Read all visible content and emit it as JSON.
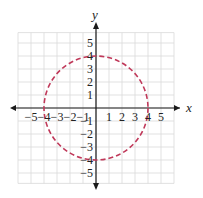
{
  "chart_data": {
    "type": "line",
    "title": "",
    "xlabel": "x",
    "ylabel": "y",
    "xlim": [
      -6,
      6
    ],
    "ylim": [
      -6,
      6
    ],
    "grid": true,
    "x_ticks": [
      -5,
      -4,
      -3,
      -2,
      -1,
      1,
      2,
      3,
      4,
      5
    ],
    "y_ticks": [
      5,
      4,
      3,
      2,
      1,
      -1,
      -2,
      -3,
      -4,
      -5
    ],
    "series": [
      {
        "name": "circle",
        "shape": "circle",
        "center": [
          0,
          0
        ],
        "radius": 4,
        "style": "dashed",
        "color": "#c0395a"
      }
    ],
    "intercepts": [
      [
        -4,
        0
      ],
      [
        4,
        0
      ],
      [
        0,
        4
      ],
      [
        0,
        -4
      ]
    ]
  },
  "labels": {
    "x_axis": "x",
    "y_axis": "y",
    "x_ticks": [
      "−5",
      "−4",
      "−3",
      "−2",
      "−1",
      "1",
      "2",
      "3",
      "4",
      "5"
    ],
    "y_ticks": [
      "5",
      "4",
      "3",
      "2",
      "1",
      "−1",
      "−2",
      "−3",
      "−4",
      "−5"
    ]
  },
  "colors": {
    "grid": "#d9d9d9",
    "axis": "#1a1a1a",
    "curve": "#c0395a"
  }
}
